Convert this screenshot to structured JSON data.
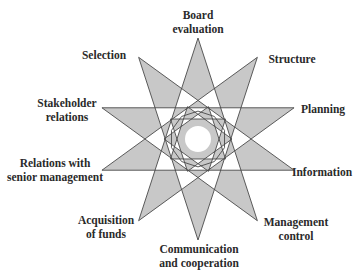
{
  "diagram": {
    "type": "ten-point star ({10/4}) with inner ornament",
    "center": [
      198,
      139
    ],
    "outer_radius": 101,
    "inner_star_radius": 34,
    "inner_circle_radius": 13,
    "colors": {
      "fill": "#c8c8c8",
      "stroke": "#4a4a4a",
      "background": "#ffffff",
      "text": "#2a2a2a"
    }
  },
  "labels": [
    {
      "id": "board-evaluation",
      "lines": [
        "Board",
        "evaluation"
      ],
      "x": 198,
      "y": 22
    },
    {
      "id": "structure",
      "lines": [
        "Structure"
      ],
      "x": 292,
      "y": 59
    },
    {
      "id": "planning",
      "lines": [
        "Planning"
      ],
      "x": 323,
      "y": 109
    },
    {
      "id": "information",
      "lines": [
        "Information"
      ],
      "x": 322,
      "y": 172
    },
    {
      "id": "management-control",
      "lines": [
        "Management",
        "control"
      ],
      "x": 296,
      "y": 229
    },
    {
      "id": "communication-and-cooperation",
      "lines": [
        "Communication",
        "and cooperation"
      ],
      "x": 199,
      "y": 256
    },
    {
      "id": "acquisition-of-funds",
      "lines": [
        "Acquisition",
        "of funds"
      ],
      "x": 106,
      "y": 227
    },
    {
      "id": "relations-with-senior-management",
      "lines": [
        "Relations with",
        "senior management"
      ],
      "x": 55,
      "y": 170
    },
    {
      "id": "stakeholder-relations",
      "lines": [
        "Stakeholder",
        "relations"
      ],
      "x": 67,
      "y": 110
    },
    {
      "id": "selection",
      "lines": [
        "Selection"
      ],
      "x": 104,
      "y": 55
    }
  ]
}
